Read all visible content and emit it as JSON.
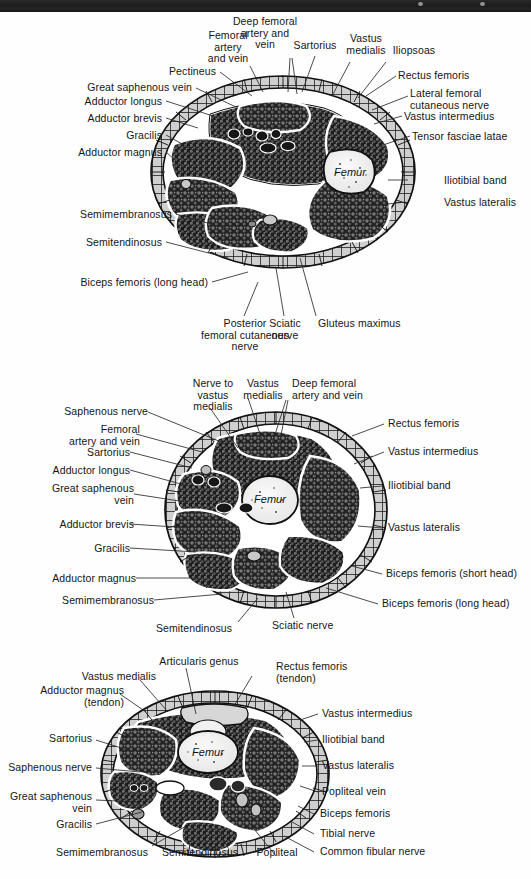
{
  "page": {
    "width": 531,
    "height": 879,
    "background": "#fefefe",
    "ink": "#151515",
    "scan_bar_color": "#1c1c1c"
  },
  "figures": [
    {
      "id": "proximal-thigh-cross-section",
      "name": "Cross section of proximal thigh",
      "bone_label": "Femur",
      "labels": [
        {
          "key": "femoral-artery-and-vein",
          "text": "Femoral\nartery\nand vein",
          "align": "center"
        },
        {
          "key": "deep-femoral-artery-and-vein",
          "text": "Deep femoral\nartery and\nvein",
          "align": "center"
        },
        {
          "key": "sartorius",
          "text": "Sartorius",
          "align": "center"
        },
        {
          "key": "vastus-medialis",
          "text": "Vastus\nmedialis",
          "align": "center"
        },
        {
          "key": "iliopsoas",
          "text": "Iliopsoas",
          "align": "center"
        },
        {
          "key": "pectineus",
          "text": "Pectineus",
          "align": "right"
        },
        {
          "key": "great-saphenous-vein",
          "text": "Great saphenous vein",
          "align": "right"
        },
        {
          "key": "adductor-longus",
          "text": "Adductor longus",
          "align": "right"
        },
        {
          "key": "adductor-brevis",
          "text": "Adductor brevis",
          "align": "right"
        },
        {
          "key": "gracilis",
          "text": "Gracilis",
          "align": "right"
        },
        {
          "key": "adductor-magnus",
          "text": "Adductor magnus",
          "align": "right"
        },
        {
          "key": "semimembranosus",
          "text": "Semimembranosus",
          "align": "right"
        },
        {
          "key": "semitendinosus",
          "text": "Semitendinosus",
          "align": "right"
        },
        {
          "key": "biceps-femoris-long-head",
          "text": "Biceps femoris (long head)",
          "align": "right"
        },
        {
          "key": "rectus-femoris",
          "text": "Rectus femoris",
          "align": "left"
        },
        {
          "key": "lateral-femoral-cutaneous-nerve",
          "text": "Lateral femoral\ncutaneous nerve",
          "align": "left"
        },
        {
          "key": "vastus-intermedius",
          "text": "Vastus intermedius",
          "align": "left"
        },
        {
          "key": "tensor-fasciae-latae",
          "text": "Tensor fasciae latae",
          "align": "left"
        },
        {
          "key": "iliotibial-band",
          "text": "Iliotibial band",
          "align": "left"
        },
        {
          "key": "vastus-lateralis",
          "text": "Vastus lateralis",
          "align": "left"
        },
        {
          "key": "posterior-femoral-cutaneous-nerve",
          "text": "Posterior\nfemoral cutaneous\nnerve",
          "align": "center"
        },
        {
          "key": "sciatic-nerve",
          "text": "Sciatic\nnerve",
          "align": "center"
        },
        {
          "key": "gluteus-maximus",
          "text": "Gluteus maximus",
          "align": "left"
        }
      ]
    },
    {
      "id": "mid-thigh-cross-section",
      "name": "Cross section of mid thigh",
      "bone_label": "Femur",
      "labels": [
        {
          "key": "nerve-to-vastus-medialis",
          "text": "Nerve to\nvastus\nmedialis",
          "align": "center"
        },
        {
          "key": "vastus-medialis",
          "text": "Vastus\nmedialis",
          "align": "center"
        },
        {
          "key": "deep-femoral-artery-and-vein",
          "text": "Deep femoral\nartery and vein",
          "align": "left"
        },
        {
          "key": "saphenous-nerve",
          "text": "Saphenous nerve",
          "align": "right"
        },
        {
          "key": "femoral-artery-and-vein",
          "text": "Femoral\nartery and vein",
          "align": "right"
        },
        {
          "key": "sartorius",
          "text": "Sartorius",
          "align": "right"
        },
        {
          "key": "adductor-longus",
          "text": "Adductor longus",
          "align": "right"
        },
        {
          "key": "great-saphenous-vein",
          "text": "Great saphenous\nvein",
          "align": "right"
        },
        {
          "key": "adductor-brevis",
          "text": "Adductor brevis",
          "align": "right"
        },
        {
          "key": "gracilis",
          "text": "Gracilis",
          "align": "right"
        },
        {
          "key": "adductor-magnus",
          "text": "Adductor magnus",
          "align": "right"
        },
        {
          "key": "semimembranosus",
          "text": "Semimembranosus",
          "align": "right"
        },
        {
          "key": "semitendinosus",
          "text": "Semitendinosus",
          "align": "center"
        },
        {
          "key": "sciatic-nerve",
          "text": "Sciatic nerve",
          "align": "left"
        },
        {
          "key": "rectus-femoris",
          "text": "Rectus femoris",
          "align": "left"
        },
        {
          "key": "vastus-intermedius",
          "text": "Vastus intermedius",
          "align": "left"
        },
        {
          "key": "iliotibial-band",
          "text": "Iliotibial band",
          "align": "left"
        },
        {
          "key": "vastus-lateralis",
          "text": "Vastus lateralis",
          "align": "left"
        },
        {
          "key": "biceps-femoris-short-head",
          "text": "Biceps femoris (short head)",
          "align": "left"
        },
        {
          "key": "biceps-femoris-long-head",
          "text": "Biceps femoris (long head)",
          "align": "left"
        }
      ]
    },
    {
      "id": "distal-thigh-cross-section",
      "name": "Cross section of distal thigh",
      "bone_label": "Femur",
      "labels": [
        {
          "key": "articularis-genus",
          "text": "Articularis genus",
          "align": "center"
        },
        {
          "key": "vastus-medialis",
          "text": "Vastus medialis",
          "align": "right"
        },
        {
          "key": "adductor-magnus-tendon",
          "text": "Adductor magnus\n(tendon)",
          "align": "right"
        },
        {
          "key": "rectus-femoris-tendon",
          "text": "Rectus femoris\n(tendon)",
          "align": "left"
        },
        {
          "key": "sartorius",
          "text": "Sartorius",
          "align": "right"
        },
        {
          "key": "saphenous-nerve",
          "text": "Saphenous nerve",
          "align": "right"
        },
        {
          "key": "great-saphenous-vein",
          "text": "Great saphenous\nvein",
          "align": "right"
        },
        {
          "key": "gracilis",
          "text": "Gracilis",
          "align": "right"
        },
        {
          "key": "semimembranosus",
          "text": "Semimembranosus",
          "align": "right"
        },
        {
          "key": "semitendinosus",
          "text": "Semitendinosus",
          "align": "center"
        },
        {
          "key": "popliteal-artery",
          "text": "Popliteal",
          "align": "center"
        },
        {
          "key": "vastus-intermedius",
          "text": "Vastus intermedius",
          "align": "left"
        },
        {
          "key": "iliotibial-band",
          "text": "Iliotibial band",
          "align": "left"
        },
        {
          "key": "vastus-lateralis",
          "text": "Vastus lateralis",
          "align": "left"
        },
        {
          "key": "popliteal-vein",
          "text": "Popliteal vein",
          "align": "left"
        },
        {
          "key": "biceps-femoris",
          "text": "Biceps femoris",
          "align": "left"
        },
        {
          "key": "tibial-nerve",
          "text": "Tibial nerve",
          "align": "left"
        },
        {
          "key": "common-fibular-nerve",
          "text": "Common fibular nerve",
          "align": "left"
        }
      ]
    }
  ]
}
